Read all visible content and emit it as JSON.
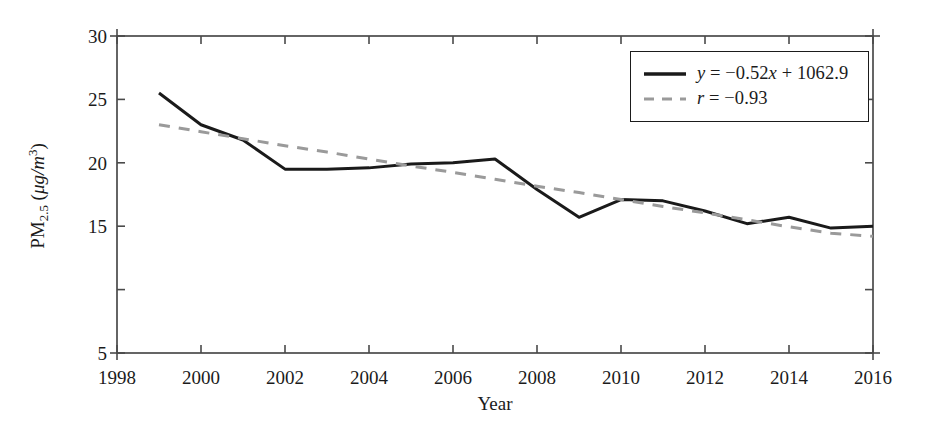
{
  "chart_data": {
    "type": "line",
    "title": "",
    "xlabel": "Year",
    "ylabel": "PM2.5 (μg/m3)",
    "ylabel_parts": {
      "prefix": "PM",
      "subscript": "2.5",
      "unit_open": " (",
      "unit_mu": "μg/m",
      "unit_sup": "3",
      "unit_close": ")"
    },
    "xlim": [
      1998,
      2016
    ],
    "ylim": [
      5,
      30
    ],
    "grid": false,
    "xticks": [
      1998,
      2000,
      2002,
      2004,
      2006,
      2008,
      2010,
      2012,
      2014,
      2016
    ],
    "xtick_labels": [
      "1998",
      "2000",
      "2002",
      "2004",
      "2006",
      "2008",
      "2010",
      "2012",
      "2014",
      "2016"
    ],
    "xminor_ticks": [
      1999,
      2001,
      2003,
      2005,
      2007,
      2009,
      2011,
      2013,
      2015
    ],
    "yticks": [
      5,
      10,
      15,
      20,
      25,
      30
    ],
    "ytick_labels": [
      "5",
      "",
      "15",
      "20",
      "25",
      "30"
    ],
    "frame": "box",
    "tick_direction": "in",
    "legend_position": "upper right",
    "x": [
      1999,
      2000,
      2001,
      2002,
      2003,
      2004,
      2005,
      2006,
      2007,
      2008,
      2009,
      2010,
      2011,
      2012,
      2013,
      2014,
      2015,
      2016
    ],
    "series": [
      {
        "name": "PM2.5 annual mean",
        "style": "solid",
        "color": "#1a1a1a",
        "width": 3.0,
        "values": [
          25.5,
          23.0,
          21.8,
          19.5,
          19.5,
          19.6,
          19.9,
          20.0,
          20.3,
          17.9,
          15.7,
          17.1,
          17.0,
          16.2,
          15.2,
          15.7,
          14.85,
          15.0
        ]
      },
      {
        "name": "linear trend",
        "style": "dashed",
        "color": "#9a9a9a",
        "width": 3.0,
        "values": [
          23.0,
          22.45,
          21.9,
          21.35,
          20.85,
          20.3,
          19.75,
          19.25,
          18.7,
          18.15,
          17.65,
          17.1,
          16.55,
          16.05,
          15.5,
          14.95,
          14.45,
          14.2
        ]
      }
    ],
    "annotations": []
  },
  "legend": {
    "entries": [
      {
        "swatch": "solid-line-swatch",
        "style": "solid",
        "color": "#1a1a1a",
        "math": {
          "y": "y",
          "rest": " = −0.52",
          "x": "x",
          "tail": " + 1062.9"
        },
        "plain": "y = −0.52x + 1062.9"
      },
      {
        "swatch": "dashed-line-swatch",
        "style": "dashed",
        "color": "#9a9a9a",
        "math": {
          "y": "r",
          "rest": " = −0.93",
          "x": "",
          "tail": ""
        },
        "plain": "r = −0.93"
      }
    ]
  },
  "colors": {
    "data_line": "#1a1a1a",
    "trend_line": "#9a9a9a",
    "axis": "#4a4a4a",
    "text": "#1b1b1b",
    "background": "#ffffff"
  },
  "geometry": {
    "plot_left": 117,
    "plot_right": 873,
    "plot_top": 36,
    "plot_bottom": 353
  }
}
